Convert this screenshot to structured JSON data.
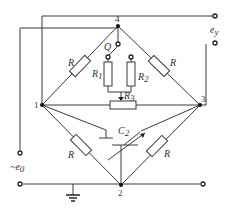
{
  "diagram": {
    "title": "",
    "nodes": [
      {
        "id": "1",
        "label": "1"
      },
      {
        "id": "2",
        "label": "2"
      },
      {
        "id": "3",
        "label": "3"
      },
      {
        "id": "4",
        "label": "4"
      }
    ],
    "components": {
      "r_top_left": {
        "label": "R"
      },
      "r_top_right": {
        "label": "R"
      },
      "r_bottom_left": {
        "label": "R"
      },
      "r_bottom_right": {
        "label": "R"
      },
      "r1": {
        "label": "R",
        "sub": "1"
      },
      "r2": {
        "label": "R",
        "sub": "2"
      },
      "r3": {
        "label": "R",
        "sub": "3"
      },
      "c2": {
        "label": "C",
        "sub": "2"
      },
      "switch_q": {
        "label": "Q"
      }
    },
    "terminals": {
      "output": {
        "label": "e",
        "sub": "y"
      },
      "input": {
        "label": "~e",
        "sub": "0"
      }
    },
    "colors": {
      "wire": "#3a3a3a",
      "background": "#ffffff"
    }
  }
}
